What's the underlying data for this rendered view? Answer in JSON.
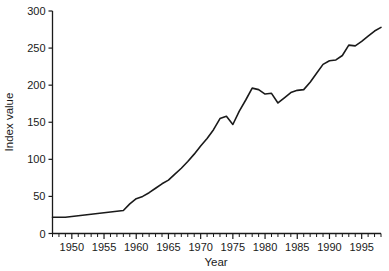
{
  "chart_data": {
    "type": "line",
    "title": "",
    "xlabel": "Year",
    "ylabel": "Index value",
    "xlim": [
      1947,
      1998
    ],
    "ylim": [
      0,
      300
    ],
    "grid": false,
    "legend": null,
    "line_color": "#1a1a1a",
    "background_color": "#ffffff",
    "y_ticks": [
      0,
      50,
      100,
      150,
      200,
      250,
      300
    ],
    "y_tick_labels": [
      "0",
      "50",
      "100",
      "150",
      "200",
      "250",
      "300"
    ],
    "x_ticks": [
      1950,
      1955,
      1960,
      1965,
      1970,
      1975,
      1980,
      1985,
      1990,
      1995
    ],
    "x_tick_labels": [
      "1950",
      "1955",
      "1960",
      "1965",
      "1970",
      "1975",
      "1980",
      "1985",
      "1990",
      "1995"
    ],
    "x_minor_tick_step": 1,
    "x": [
      1947,
      1948,
      1949,
      1950,
      1951,
      1952,
      1953,
      1954,
      1955,
      1956,
      1957,
      1958,
      1959,
      1960,
      1961,
      1962,
      1963,
      1964,
      1965,
      1966,
      1967,
      1968,
      1969,
      1970,
      1971,
      1972,
      1973,
      1974,
      1975,
      1976,
      1977,
      1978,
      1979,
      1980,
      1981,
      1982,
      1983,
      1984,
      1985,
      1986,
      1987,
      1988,
      1989,
      1990,
      1991,
      1992,
      1993,
      1994,
      1995,
      1996,
      1997,
      1998
    ],
    "values": [
      22,
      22,
      22,
      23,
      24,
      25,
      26,
      27,
      28,
      29,
      30,
      31,
      40,
      47,
      50,
      55,
      61,
      67,
      72,
      80,
      88,
      97,
      107,
      118,
      128,
      140,
      155,
      158,
      147,
      165,
      180,
      196,
      194,
      188,
      189,
      176,
      183,
      190,
      193,
      194,
      204,
      216,
      228,
      233,
      234,
      240,
      254,
      253,
      259,
      266,
      273,
      278
    ],
    "series_name": "Index value"
  }
}
